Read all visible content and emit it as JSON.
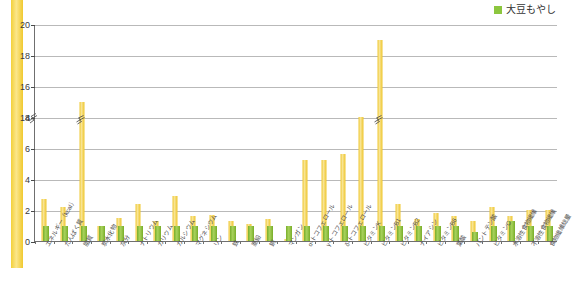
{
  "legend": {
    "label": "大豆もやし",
    "color": "#8cc63e"
  },
  "colors": {
    "bar_reference": "#efc832",
    "bar_series": "#8cc63e",
    "grid": "#b9b9b9",
    "axis": "#6f6f6f",
    "strip": "#f3d03a"
  },
  "chart_data": {
    "type": "bar",
    "title": "",
    "xlabel": "",
    "ylabel": "",
    "ylim": [
      0,
      20
    ],
    "yticks": [
      0,
      2,
      4,
      6,
      8,
      14,
      16,
      18,
      20
    ],
    "axis_break": {
      "between": [
        8,
        14
      ],
      "present": true
    },
    "grid": true,
    "legend_position": "top-right",
    "categories": [
      "エネルギー（kcal）",
      "たんぱく質",
      "脂質",
      "炭水化物",
      "灰分",
      "ナトリウム",
      "カリウム",
      "カルシウム",
      "マグネシウム",
      "リン",
      "鉄",
      "亜鉛",
      "銅",
      "マンガン",
      "α-トコフェロール",
      "γ-トコフェロール",
      "δ-トコフェロール",
      "ビタミンK",
      "ビタミンB1",
      "ビタミンB2",
      "ナイアシン",
      "ビタミンB6",
      "葉酸",
      "パントテン酸",
      "ビタミンC",
      "水溶性食物繊維",
      "不溶性食物繊維",
      "食物繊維総量"
    ],
    "series": [
      {
        "name": "基準値",
        "color": "#efc832",
        "values": [
          2.7,
          2.2,
          15.0,
          1.0,
          1.5,
          2.4,
          1.3,
          2.9,
          1.6,
          1.7,
          1.3,
          1.1,
          1.4,
          0.1,
          5.2,
          5.2,
          5.6,
          8.0,
          19.0,
          2.4,
          1.4,
          1.8,
          1.6,
          1.3,
          2.2,
          1.6,
          2.0,
          2.0
        ]
      },
      {
        "name": "大豆もやし",
        "color": "#8cc63e",
        "values": [
          1.0,
          1.0,
          1.0,
          1.0,
          1.0,
          1.0,
          1.0,
          1.0,
          1.0,
          1.0,
          1.0,
          1.0,
          1.0,
          1.0,
          1.0,
          1.0,
          1.0,
          1.0,
          1.0,
          1.0,
          1.0,
          1.0,
          1.0,
          0.6,
          1.0,
          1.3,
          1.0,
          1.0
        ]
      }
    ],
    "broken_bars": [
      2,
      18
    ]
  }
}
